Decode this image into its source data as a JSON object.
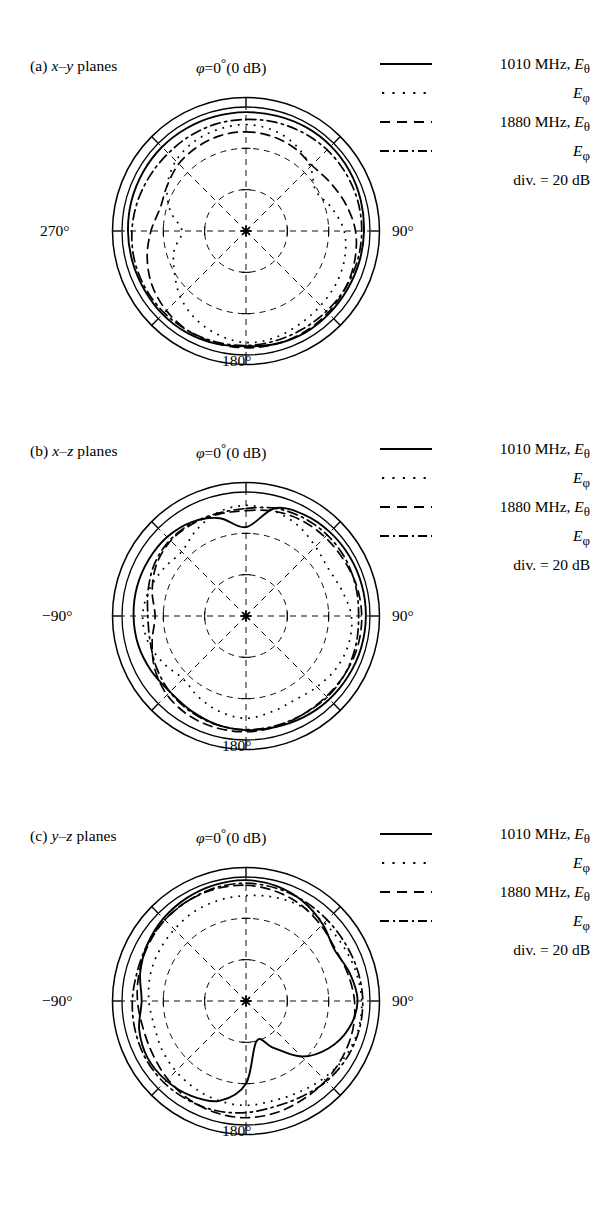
{
  "figure": {
    "type": "polar-radiation-patterns",
    "panel_count": 3
  },
  "legend": {
    "rows": [
      {
        "style": "solid",
        "label_html": "1010 MHz, <i>E</i><sub>&#952;</sub>",
        "label_text": "1010 MHz, Eθ",
        "frequency": "1010 MHz",
        "component": "E_theta"
      },
      {
        "style": "dotted",
        "label_html": "<i>E</i><sub>&#966;</sub>",
        "label_text": "Eφ",
        "frequency": "1010 MHz",
        "component": "E_phi"
      },
      {
        "style": "dashed",
        "label_html": "1880 MHz, <i>E</i><sub>&#952;</sub>",
        "label_text": "1880 MHz, Eθ",
        "frequency": "1880 MHz",
        "component": "E_theta"
      },
      {
        "style": "dashdot",
        "label_html": "<i>E</i><sub>&#966;</sub>",
        "label_text": "Eφ",
        "frequency": "1880 MHz",
        "component": "E_phi"
      }
    ],
    "division_note": "div. = 20 dB",
    "division_db": 20
  },
  "panels": [
    {
      "id": "a",
      "caption_html": "(a) <i>x</i>&#8211;<i>y</i> planes",
      "caption_text": "(a) x–y planes",
      "plane": "x-y",
      "top_label_html": "<i>&#966;</i>=0<sup>&#176;</sup>(0 dB)",
      "top_label_text": "φ=0°(0 dB)",
      "left_label": "270°",
      "right_label": "90°",
      "bottom_label": "180°"
    },
    {
      "id": "b",
      "caption_html": "(b) <i>x</i>&#8211;<i>z</i> planes",
      "caption_text": "(b) x–z planes",
      "plane": "x-z",
      "top_label_html": "<i>&#966;</i>=0<sup>&#176;</sup>(0 dB)",
      "top_label_text": "φ=0°(0 dB)",
      "left_label": "−90°",
      "right_label": "90°",
      "bottom_label": "180°"
    },
    {
      "id": "c",
      "caption_html": "(c) <i>y</i>&#8211;<i>z</i> planes",
      "caption_text": "(c) y–z planes",
      "plane": "y-z",
      "top_label_html": "<i>&#966;</i>=0<sup>&#176;</sup>(0 dB)",
      "top_label_text": "φ=0°(0 dB)",
      "left_label": "−90°",
      "right_label": "90°",
      "bottom_label": "180°"
    }
  ],
  "chart_data": {
    "type": "line",
    "title": "",
    "subtype": "polar",
    "radial_axis": {
      "label": "Relative power",
      "unit": "dB",
      "outer_value": 0,
      "division": 20,
      "rings": 3,
      "min_value": -60
    },
    "angular_axis": {
      "unit": "degrees",
      "gridlines_every": 45,
      "ticks_every": 45
    },
    "legend_position": "top-right",
    "grid": true,
    "panels": [
      {
        "id": "a",
        "plane": "x-y",
        "angle_labels": {
          "top": "0",
          "right": "90",
          "bottom": "180",
          "left": "270"
        },
        "series": [
          {
            "name": "1010 MHz, E_theta",
            "style": "solid",
            "angles_deg": [
              0,
              15,
              30,
              45,
              60,
              75,
              90,
              105,
              120,
              135,
              150,
              165,
              180,
              195,
              210,
              225,
              240,
              255,
              270,
              285,
              300,
              315,
              330,
              345
            ],
            "values_db": [
              -2.5,
              -2.3,
              -2.0,
              -1.9,
              -2.1,
              -2.5,
              -2.9,
              -3.2,
              -3.4,
              -3.3,
              -3.1,
              -3.5,
              -4.2,
              -3.6,
              -3.1,
              -3.0,
              -3.2,
              -3.1,
              -2.9,
              -2.7,
              -2.6,
              -2.5,
              -2.6,
              -2.6
            ]
          },
          {
            "name": "1010 MHz, E_phi",
            "style": "dotted",
            "angles_deg": [
              0,
              15,
              30,
              45,
              60,
              75,
              90,
              105,
              120,
              135,
              150,
              165,
              180,
              195,
              210,
              225,
              240,
              255,
              270,
              285,
              300,
              315,
              330,
              345
            ],
            "values_db": [
              -8.5,
              -9.5,
              -12.0,
              -16.0,
              -21.0,
              -17.0,
              -12.5,
              -10.5,
              -9.5,
              -9.0,
              -8.0,
              -6.5,
              -6.0,
              -8.0,
              -11.0,
              -15.0,
              -20.0,
              -24.0,
              -29.0,
              -22.0,
              -16.0,
              -12.0,
              -10.0,
              -9.0
            ]
          },
          {
            "name": "1880 MHz, E_theta",
            "style": "dashed",
            "angles_deg": [
              0,
              15,
              30,
              45,
              60,
              75,
              90,
              105,
              120,
              135,
              150,
              165,
              180,
              195,
              210,
              225,
              240,
              255,
              270,
              285,
              300,
              315,
              330,
              345
            ],
            "values_db": [
              -12.0,
              -12.5,
              -13.5,
              -15.0,
              -13.0,
              -10.0,
              -7.0,
              -5.5,
              -4.5,
              -4.0,
              -3.6,
              -3.4,
              -3.5,
              -3.8,
              -4.2,
              -5.5,
              -7.5,
              -10.5,
              -14.0,
              -17.0,
              -16.0,
              -14.0,
              -13.0,
              -12.2
            ]
          },
          {
            "name": "1880 MHz, E_phi",
            "style": "dashdot",
            "angles_deg": [
              0,
              15,
              30,
              45,
              60,
              75,
              90,
              105,
              120,
              135,
              150,
              165,
              180,
              195,
              210,
              225,
              240,
              255,
              270,
              285,
              300,
              315,
              330,
              345
            ],
            "values_db": [
              -6.0,
              -5.5,
              -5.0,
              -4.5,
              -4.2,
              -4.0,
              -4.0,
              -4.2,
              -4.6,
              -5.0,
              -5.2,
              -5.0,
              -4.6,
              -4.4,
              -4.2,
              -4.0,
              -4.0,
              -4.2,
              -4.8,
              -5.6,
              -6.4,
              -6.8,
              -6.6,
              -6.2
            ]
          }
        ]
      },
      {
        "id": "b",
        "plane": "x-z",
        "angle_labels": {
          "top": "0",
          "right": "90",
          "bottom": "180",
          "left": "-90"
        },
        "series": [
          {
            "name": "1010 MHz, E_theta",
            "style": "solid",
            "angles_deg": [
              0,
              15,
              30,
              45,
              60,
              75,
              90,
              105,
              120,
              135,
              150,
              165,
              180,
              195,
              210,
              225,
              240,
              255,
              270,
              285,
              300,
              315,
              330,
              345
            ],
            "values_db": [
              -17.0,
              -6.0,
              -3.5,
              -2.6,
              -2.2,
              -2.0,
              -2.0,
              -2.2,
              -2.6,
              -3.0,
              -3.6,
              -4.4,
              -4.8,
              -5.6,
              -7.0,
              -8.0,
              -7.0,
              -6.0,
              -5.6,
              -5.4,
              -5.6,
              -6.0,
              -7.5,
              -11.0
            ]
          },
          {
            "name": "1010 MHz, E_phi",
            "style": "dotted",
            "angles_deg": [
              0,
              15,
              30,
              45,
              60,
              75,
              90,
              105,
              120,
              135,
              150,
              165,
              180,
              195,
              210,
              225,
              240,
              255,
              270,
              285,
              300,
              315,
              330,
              345
            ],
            "values_db": [
              -6.5,
              -7.5,
              -9.5,
              -12.5,
              -14.0,
              -12.0,
              -9.0,
              -8.5,
              -9.5,
              -11.5,
              -13.0,
              -12.0,
              -10.5,
              -12.0,
              -14.5,
              -17.0,
              -14.0,
              -11.0,
              -10.0,
              -11.5,
              -14.0,
              -16.0,
              -12.0,
              -8.0
            ]
          },
          {
            "name": "1880 MHz, E_theta",
            "style": "dashed",
            "angles_deg": [
              0,
              15,
              30,
              45,
              60,
              75,
              90,
              105,
              120,
              135,
              150,
              165,
              180,
              195,
              210,
              225,
              240,
              255,
              270,
              285,
              300,
              315,
              330,
              345
            ],
            "values_db": [
              -9.0,
              -7.5,
              -6.5,
              -6.0,
              -5.5,
              -4.5,
              -4.0,
              -4.0,
              -4.5,
              -5.0,
              -5.0,
              -4.5,
              -4.0,
              -4.0,
              -4.5,
              -6.0,
              -9.0,
              -13.0,
              -16.0,
              -13.0,
              -10.0,
              -8.5,
              -8.5,
              -9.0
            ]
          },
          {
            "name": "1880 MHz, E_phi",
            "style": "dashdot",
            "angles_deg": [
              0,
              15,
              30,
              45,
              60,
              75,
              90,
              105,
              120,
              135,
              150,
              165,
              180,
              195,
              210,
              225,
              240,
              255,
              270,
              285,
              300,
              315,
              330,
              345
            ],
            "values_db": [
              -8.0,
              -6.0,
              -5.0,
              -4.5,
              -4.5,
              -5.0,
              -5.5,
              -5.0,
              -4.5,
              -4.5,
              -5.0,
              -5.0,
              -5.0,
              -5.5,
              -6.5,
              -8.0,
              -10.0,
              -12.0,
              -12.5,
              -11.0,
              -9.0,
              -8.0,
              -8.0,
              -8.5
            ]
          }
        ]
      },
      {
        "id": "c",
        "plane": "y-z",
        "angle_labels": {
          "top": "0",
          "right": "90",
          "bottom": "180",
          "left": "-90"
        },
        "series": [
          {
            "name": "1010 MHz, E_theta",
            "style": "solid",
            "angles_deg": [
              0,
              15,
              30,
              45,
              60,
              75,
              90,
              105,
              120,
              135,
              150,
              165,
              180,
              195,
              210,
              225,
              240,
              255,
              270,
              285,
              300,
              315,
              330,
              345
            ],
            "values_db": [
              -1.5,
              -2.5,
              -4.5,
              -7.5,
              -10.5,
              -8.0,
              -6.0,
              -8.5,
              -14.0,
              -22.0,
              -34.0,
              -40.0,
              -20.0,
              -10.0,
              -7.0,
              -5.5,
              -5.0,
              -6.5,
              -9.5,
              -7.0,
              -5.0,
              -3.5,
              -2.5,
              -1.8
            ]
          },
          {
            "name": "1010 MHz, E_phi",
            "style": "dotted",
            "angles_deg": [
              0,
              15,
              30,
              45,
              60,
              75,
              90,
              105,
              120,
              135,
              150,
              165,
              180,
              195,
              210,
              225,
              240,
              255,
              270,
              285,
              300,
              315,
              330,
              345
            ],
            "values_db": [
              -9.0,
              -8.0,
              -7.0,
              -6.5,
              -6.0,
              -5.0,
              -4.0,
              -4.0,
              -5.0,
              -7.0,
              -9.0,
              -10.0,
              -9.5,
              -10.0,
              -11.0,
              -12.0,
              -13.0,
              -14.0,
              -13.0,
              -12.0,
              -11.5,
              -11.0,
              -10.0,
              -9.5
            ]
          },
          {
            "name": "1880 MHz, E_theta",
            "style": "dashed",
            "angles_deg": [
              0,
              15,
              30,
              45,
              60,
              75,
              90,
              105,
              120,
              135,
              150,
              165,
              180,
              195,
              210,
              225,
              240,
              255,
              270,
              285,
              300,
              315,
              330,
              345
            ],
            "values_db": [
              -4.0,
              -5.0,
              -6.5,
              -8.5,
              -10.0,
              -9.0,
              -7.5,
              -6.5,
              -6.0,
              -5.5,
              -5.0,
              -4.0,
              -3.5,
              -4.0,
              -5.0,
              -6.5,
              -8.0,
              -8.5,
              -7.5,
              -6.5,
              -5.5,
              -4.5,
              -4.0,
              -3.8
            ]
          },
          {
            "name": "1880 MHz, E_phi",
            "style": "dashdot",
            "angles_deg": [
              0,
              15,
              30,
              45,
              60,
              75,
              90,
              105,
              120,
              135,
              150,
              165,
              180,
              195,
              210,
              225,
              240,
              255,
              270,
              285,
              300,
              315,
              330,
              345
            ],
            "values_db": [
              -3.0,
              -3.5,
              -4.0,
              -4.5,
              -4.5,
              -4.0,
              -3.5,
              -3.5,
              -4.0,
              -5.0,
              -6.5,
              -7.0,
              -6.0,
              -5.0,
              -4.5,
              -4.0,
              -4.0,
              -4.5,
              -5.0,
              -5.5,
              -5.0,
              -4.5,
              -4.0,
              -3.2
            ]
          }
        ]
      }
    ]
  }
}
